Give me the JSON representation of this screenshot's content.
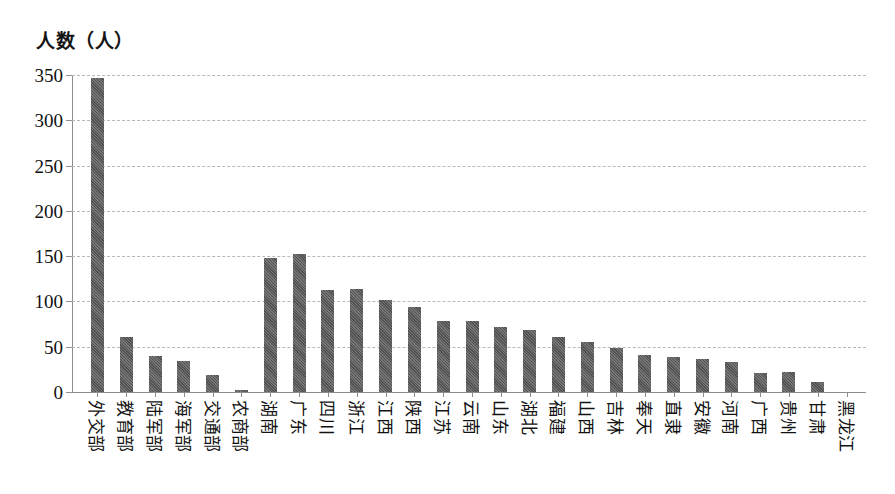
{
  "chart_data": {
    "type": "bar",
    "title": "",
    "subtitle": "",
    "xlabel": "",
    "ylabel": "人数（人）",
    "ylim": [
      0,
      350
    ],
    "yticks": [
      0,
      50,
      100,
      150,
      200,
      250,
      300,
      350
    ],
    "ytick_labels": [
      "0",
      "50",
      "100",
      "150",
      "200",
      "250",
      "300",
      "350"
    ],
    "grid": true,
    "legend": false,
    "legend_position": "none",
    "bar_color": "#5c5c5c",
    "categories": [
      "外交部",
      "教育部",
      "陆军部",
      "海军部",
      "交通部",
      "农商部",
      "湖南",
      "广东",
      "四川",
      "浙江",
      "江西",
      "陕西",
      "江苏",
      "云南",
      "山东",
      "湖北",
      "福建",
      "山西",
      "吉林",
      "奉天",
      "直隶",
      "安徽",
      "河南",
      "广西",
      "贵州",
      "甘肃",
      "黑龙江"
    ],
    "values": [
      347,
      61,
      40,
      34,
      19,
      2,
      148,
      152,
      113,
      114,
      102,
      94,
      78,
      78,
      72,
      69,
      61,
      55,
      49,
      41,
      39,
      36,
      33,
      21,
      22,
      11,
      0
    ]
  }
}
